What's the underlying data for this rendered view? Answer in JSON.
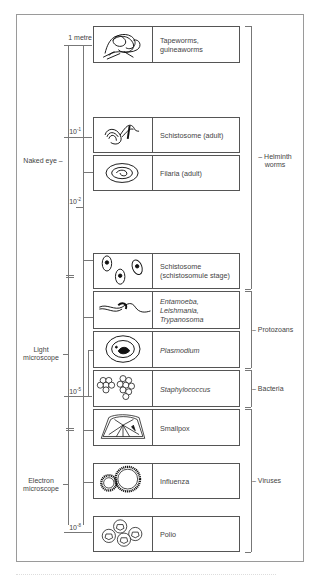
{
  "diagram": {
    "scale_labels": [
      {
        "base": "1 metre",
        "exp": ""
      },
      {
        "base": "10",
        "exp": "-1"
      },
      {
        "base": "10",
        "exp": "-2"
      },
      {
        "base": "10",
        "exp": "-5"
      },
      {
        "base": "10",
        "exp": "-8"
      }
    ],
    "visibility_ranges": [
      {
        "label": "Naked eye"
      },
      {
        "label": "Light microscope",
        "line1": "Light",
        "line2": "microscope"
      },
      {
        "label": "Electron microscope",
        "line1": "Electron",
        "line2": "microscope"
      }
    ],
    "organisms": [
      {
        "label": "Tapeworms, guineaworms",
        "line1": "Tapeworms,",
        "line2": "guineaworms",
        "icon": "tapeworm-icon",
        "italic": false
      },
      {
        "label": "Schistosome (adult)",
        "icon": "schistosome-adult-icon",
        "italic": false
      },
      {
        "label": "Filaria (adult)",
        "icon": "filaria-icon",
        "italic": false
      },
      {
        "label": "Schistosome (schistosomule stage)",
        "line1": "Schistosome",
        "line2": "(schistosomule stage)",
        "icon": "schistosomule-icon",
        "italic": false
      },
      {
        "label": "Entamoeba, Leishmania, Trypanosoma",
        "line1": "Entamoeba,",
        "line2": "Leishmania,",
        "line3": "Trypanosoma",
        "icon": "trypanosoma-icon",
        "italic": true
      },
      {
        "label": "Plasmodium",
        "icon": "plasmodium-icon",
        "italic": true
      },
      {
        "label": "Staphylococcus",
        "icon": "staphylococcus-icon",
        "italic": true
      },
      {
        "label": "Smallpox",
        "icon": "smallpox-icon",
        "italic": false
      },
      {
        "label": "Influenza",
        "icon": "influenza-icon",
        "italic": false
      },
      {
        "label": "Polio",
        "icon": "polio-icon",
        "italic": false
      }
    ],
    "groups": [
      {
        "label": "Helminth worms",
        "line1": "Helminth",
        "line2": "worms"
      },
      {
        "label": "Protozoans"
      },
      {
        "label": "Bacteria"
      },
      {
        "label": "Viruses"
      }
    ]
  }
}
